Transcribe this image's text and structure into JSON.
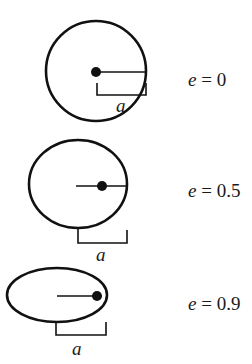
{
  "diagram": {
    "semi_major_axis_label": "a",
    "orbits": [
      {
        "eccentricity_label": "e = 0",
        "e_var": "e",
        "e_rest": " = 0",
        "a_label": "a"
      },
      {
        "eccentricity_label": "e = 0.5",
        "e_var": "e",
        "e_rest": " = 0.5",
        "a_label": "a"
      },
      {
        "eccentricity_label": "e = 0.9",
        "e_var": "e",
        "e_rest": " = 0.9",
        "a_label": "a"
      }
    ],
    "colors": {
      "stroke": "#111111",
      "background": "#ffffff"
    }
  }
}
